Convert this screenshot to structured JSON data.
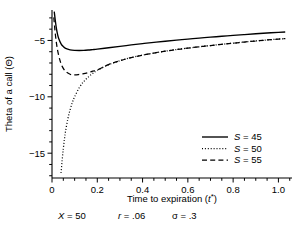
{
  "chart_data": {
    "type": "line",
    "title": "",
    "xlabel": "Time to expiration (t*)",
    "ylabel": "Theta of a call (Θ)",
    "xlim": [
      0,
      1.06
    ],
    "ylim": [
      -17.2,
      -2.3
    ],
    "xticks": [
      "0",
      "0.2",
      "0.4",
      "0.6",
      "0.8",
      "1.0"
    ],
    "xtick_values": [
      0,
      0.2,
      0.4,
      0.6,
      0.8,
      1.0
    ],
    "yticks": [
      "−5",
      "−10",
      "−15"
    ],
    "ytick_values": [
      -5,
      -10,
      -15
    ],
    "grid": false,
    "legend_position": "lower right",
    "series": [
      {
        "name": "S = 45",
        "style": "solid",
        "x": [
          0.01,
          0.015,
          0.02,
          0.025,
          0.03,
          0.04,
          0.05,
          0.06,
          0.08,
          0.1,
          0.12,
          0.14,
          0.16,
          0.18,
          0.2,
          0.25,
          0.3,
          0.35,
          0.4,
          0.45,
          0.5,
          0.55,
          0.6,
          0.65,
          0.7,
          0.75,
          0.8,
          0.85,
          0.9,
          0.95,
          1.0,
          1.03
        ],
        "y": [
          -2.45,
          -3.3,
          -4.0,
          -4.5,
          -4.85,
          -5.3,
          -5.55,
          -5.7,
          -5.83,
          -5.88,
          -5.89,
          -5.88,
          -5.85,
          -5.81,
          -5.77,
          -5.65,
          -5.52,
          -5.4,
          -5.28,
          -5.17,
          -5.07,
          -4.97,
          -4.88,
          -4.79,
          -4.71,
          -4.63,
          -4.55,
          -4.48,
          -4.41,
          -4.34,
          -4.28,
          -4.25
        ]
      },
      {
        "name": "S = 50",
        "style": "dotted",
        "x": [
          0.04,
          0.045,
          0.05,
          0.055,
          0.06,
          0.07,
          0.08,
          0.09,
          0.1,
          0.12,
          0.14,
          0.16,
          0.18,
          0.2,
          0.25,
          0.3,
          0.35,
          0.4,
          0.45,
          0.5,
          0.55,
          0.6,
          0.65,
          0.7,
          0.75,
          0.8,
          0.85,
          0.9,
          0.95,
          1.0,
          1.03
        ],
        "y": [
          -16.75,
          -15.6,
          -14.6,
          -13.75,
          -13.05,
          -11.95,
          -11.15,
          -10.5,
          -10.0,
          -9.2,
          -8.65,
          -8.25,
          -7.92,
          -7.65,
          -7.15,
          -6.8,
          -6.52,
          -6.3,
          -6.12,
          -5.95,
          -5.81,
          -5.68,
          -5.56,
          -5.45,
          -5.34,
          -5.24,
          -5.14,
          -5.05,
          -4.96,
          -4.88,
          -4.84
        ]
      },
      {
        "name": "S = 55",
        "style": "dashed",
        "x": [
          0.008,
          0.012,
          0.018,
          0.025,
          0.035,
          0.045,
          0.06,
          0.08,
          0.1,
          0.12,
          0.14,
          0.16,
          0.18,
          0.2,
          0.25,
          0.3,
          0.35,
          0.4,
          0.45,
          0.5,
          0.55,
          0.6,
          0.65,
          0.7,
          0.75,
          0.8,
          0.85,
          0.9,
          0.95,
          1.0,
          1.03
        ],
        "y": [
          -2.95,
          -3.9,
          -5.0,
          -5.9,
          -6.75,
          -7.3,
          -7.75,
          -8.0,
          -8.06,
          -8.02,
          -7.95,
          -7.85,
          -7.73,
          -7.62,
          -7.14,
          -6.8,
          -6.52,
          -6.3,
          -6.12,
          -5.95,
          -5.81,
          -5.68,
          -5.56,
          -5.45,
          -5.34,
          -5.24,
          -5.14,
          -5.05,
          -4.96,
          -4.88,
          -4.84
        ]
      }
    ]
  },
  "legend": {
    "entries": [
      {
        "label": "S = 45",
        "symbol": "S",
        "value": "= 45",
        "style": "solid"
      },
      {
        "label": "S = 50",
        "symbol": "S",
        "value": "= 50",
        "style": "dotted"
      },
      {
        "label": "S = 55",
        "symbol": "S",
        "value": "= 55",
        "style": "dashed"
      }
    ]
  },
  "axes": {
    "y_title": "Theta of a call (Θ)",
    "x_title_prefix": "Time to expiration (",
    "x_title_var": "t",
    "x_title_sup": "*",
    "x_title_suffix": ")",
    "xtick_labels": [
      "0",
      "0.2",
      "0.4",
      "0.6",
      "0.8",
      "1.0"
    ],
    "ytick_labels": [
      "−5",
      "−10",
      "−15"
    ]
  },
  "footer": {
    "params": [
      {
        "symbol": "X",
        "value": "= 50"
      },
      {
        "symbol": "r",
        "value": "= .06"
      },
      {
        "symbol": "σ",
        "value": "= .3"
      }
    ]
  },
  "colors": {
    "line": "#000000",
    "background": "#ffffff",
    "text": "#000000"
  }
}
